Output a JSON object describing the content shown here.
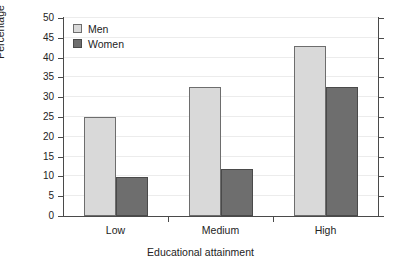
{
  "chart_data": {
    "type": "bar",
    "title": "",
    "subtitle": "",
    "categories": [
      "Low",
      "Medium",
      "High"
    ],
    "series": [
      {
        "name": "Men",
        "color": "#d9d9d9",
        "values": [
          25,
          32.5,
          43
        ]
      },
      {
        "name": "Women",
        "color": "#6e6e6e",
        "values": [
          9.8,
          11.8,
          32.5
        ]
      }
    ],
    "xlabel": "Educational attainment",
    "ylabel": "Percentage",
    "ylim": [
      0,
      50
    ],
    "ytick_step": 5,
    "yticks": [
      0,
      5,
      10,
      15,
      20,
      25,
      30,
      35,
      40,
      45,
      50
    ],
    "ytick_labels": [
      "0",
      "5",
      "10",
      "15",
      "20",
      "25",
      "30",
      "35",
      "40",
      "45",
      "50"
    ],
    "xtick_labels": [
      "Low",
      "Medium",
      "High"
    ],
    "grid": "horizontal",
    "grid_color": "#ececec",
    "legend_position": "top-left-inside",
    "legend_entries": [
      "Men",
      "Women"
    ],
    "axis_color": "#4a4a4a",
    "background": "#ffffff",
    "annotations": []
  }
}
